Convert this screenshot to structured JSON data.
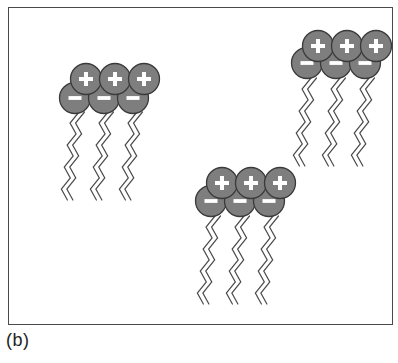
{
  "figure": {
    "caption": "(b)",
    "domain_label": "surfactant-bilayer-aggregates-diagram",
    "background_color": "#ffffff",
    "frame": {
      "border_color": "#4a4a4a",
      "fill_color": "#ffffff",
      "x": 8,
      "y": 7,
      "width": 385,
      "height": 318
    }
  },
  "style": {
    "head_fill": "#7e7e7e",
    "head_stroke": "#3a3a3a",
    "symbol_color": "#ffffff",
    "tail_color": "#4b4b4b",
    "circle_radius": 15.5,
    "tail_stroke_width": 1.2
  },
  "legend": {
    "positive_symbol": "+",
    "negative_symbol": "−",
    "head_count_per_row": 3,
    "rows_per_cluster": 2,
    "tails_per_cluster": 3,
    "tail_strands_each": 2
  },
  "clusters": [
    {
      "id": "cluster-left",
      "name": "surfactant-aggregate-left",
      "plus_row": {
        "symbol": "+",
        "centers": [
          {
            "cx": 86,
            "cy": 79
          },
          {
            "cx": 115,
            "cy": 79
          },
          {
            "cx": 144,
            "cy": 79
          }
        ]
      },
      "minus_row": {
        "symbol": "−",
        "centers": [
          {
            "cx": 75,
            "cy": 98
          },
          {
            "cx": 104,
            "cy": 98
          },
          {
            "cx": 133,
            "cy": 98
          }
        ]
      },
      "tails": [
        {
          "x": 79,
          "y": 112,
          "length": 86
        },
        {
          "x": 108,
          "y": 112,
          "length": 86
        },
        {
          "x": 137,
          "y": 112,
          "length": 86
        }
      ]
    },
    {
      "id": "cluster-right",
      "name": "surfactant-aggregate-top-right",
      "plus_row": {
        "symbol": "+",
        "centers": [
          {
            "cx": 318,
            "cy": 46
          },
          {
            "cx": 347,
            "cy": 46
          },
          {
            "cx": 376,
            "cy": 46
          }
        ]
      },
      "minus_row": {
        "symbol": "−",
        "centers": [
          {
            "cx": 307,
            "cy": 63
          },
          {
            "cx": 336,
            "cy": 63
          },
          {
            "cx": 365,
            "cy": 63
          }
        ]
      },
      "tails": [
        {
          "x": 311,
          "y": 78,
          "length": 82
        },
        {
          "x": 340,
          "y": 78,
          "length": 82
        },
        {
          "x": 369,
          "y": 78,
          "length": 82
        }
      ]
    },
    {
      "id": "cluster-middle",
      "name": "surfactant-aggregate-middle",
      "plus_row": {
        "symbol": "+",
        "centers": [
          {
            "cx": 222,
            "cy": 183
          },
          {
            "cx": 251,
            "cy": 183
          },
          {
            "cx": 280,
            "cy": 183
          }
        ]
      },
      "minus_row": {
        "symbol": "−",
        "centers": [
          {
            "cx": 211,
            "cy": 201
          },
          {
            "cx": 240,
            "cy": 201
          },
          {
            "cx": 269,
            "cy": 201
          }
        ]
      },
      "tails": [
        {
          "x": 215,
          "y": 216,
          "length": 88
        },
        {
          "x": 244,
          "y": 216,
          "length": 88
        },
        {
          "x": 273,
          "y": 216,
          "length": 88
        }
      ]
    }
  ]
}
